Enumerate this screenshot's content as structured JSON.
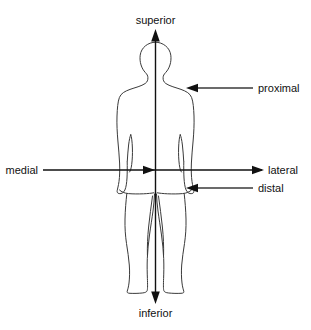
{
  "diagram": {
    "type": "anatomical-reference-diagram",
    "figure": "human body outline, anterior view",
    "background_color": "#ffffff",
    "line_color": "#3a3a3a",
    "axis_color": "#111111",
    "text_color": "#111111",
    "labels": {
      "superior": "superior",
      "inferior": "inferior",
      "medial": "medial",
      "lateral": "lateral",
      "proximal": "proximal",
      "distal": "distal"
    },
    "axes": [
      {
        "name": "vertical-axis",
        "from_label": "inferior",
        "to_label": "superior",
        "orientation": "vertical",
        "double_headed": true
      },
      {
        "name": "horizontal-axis",
        "from_label": "medial",
        "to_label": "lateral",
        "orientation": "horizontal",
        "double_headed": false
      }
    ],
    "callouts": [
      {
        "name": "proximal-callout",
        "label": "proximal",
        "points_to": "shoulder",
        "side": "right"
      },
      {
        "name": "distal-callout",
        "label": "distal",
        "points_to": "hand",
        "side": "right"
      }
    ]
  }
}
